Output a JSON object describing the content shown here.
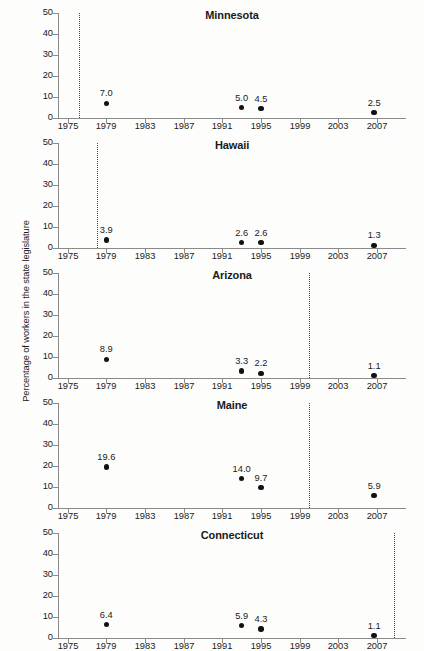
{
  "chart_data": {
    "type": "scatter",
    "title": "",
    "xlabel": "",
    "ylabel": "Percentage of workers in the state legislature",
    "xlim": [
      1974,
      2010
    ],
    "ylim": [
      0,
      50
    ],
    "yticks": [
      0,
      10,
      20,
      30,
      40,
      50
    ],
    "xticks": [
      1975,
      1979,
      1983,
      1987,
      1991,
      1995,
      1999,
      2003,
      2007
    ],
    "grid": false,
    "legend": null,
    "marker_color": "#111111",
    "axis_color": "#8a8a8a",
    "reference_line_style": "dotted",
    "panels": [
      {
        "title": "Minnesota",
        "reference_year": 1976.2,
        "x": [
          1979,
          1993,
          1995,
          2006.7
        ],
        "values": [
          7.0,
          5.0,
          4.5,
          2.5
        ],
        "labels": [
          "7.0",
          "5.0",
          "4.5",
          "2.5"
        ]
      },
      {
        "title": "Hawaii",
        "reference_year": 1978.0,
        "x": [
          1979,
          1993,
          1995,
          2006.7
        ],
        "values": [
          3.9,
          2.6,
          2.6,
          1.3
        ],
        "labels": [
          "3.9",
          "2.6",
          "2.6",
          "1.3"
        ]
      },
      {
        "title": "Arizona",
        "reference_year": 2000.0,
        "x": [
          1979,
          1993,
          1995,
          2006.7
        ],
        "values": [
          8.9,
          3.3,
          2.2,
          1.1
        ],
        "labels": [
          "8.9",
          "3.3",
          "2.2",
          "1.1"
        ]
      },
      {
        "title": "Maine",
        "reference_year": 2000.0,
        "x": [
          1979,
          1993,
          1995,
          2006.7
        ],
        "values": [
          19.6,
          14.0,
          9.7,
          5.9
        ],
        "labels": [
          "19.6",
          "14.0",
          "9.7",
          "5.9"
        ]
      },
      {
        "title": "Connecticut",
        "reference_year": 2008.8,
        "x": [
          1979,
          1993,
          1995,
          2006.7
        ],
        "values": [
          6.4,
          5.9,
          4.3,
          1.1
        ],
        "labels": [
          "6.4",
          "5.9",
          "4.3",
          "1.1"
        ]
      }
    ]
  }
}
